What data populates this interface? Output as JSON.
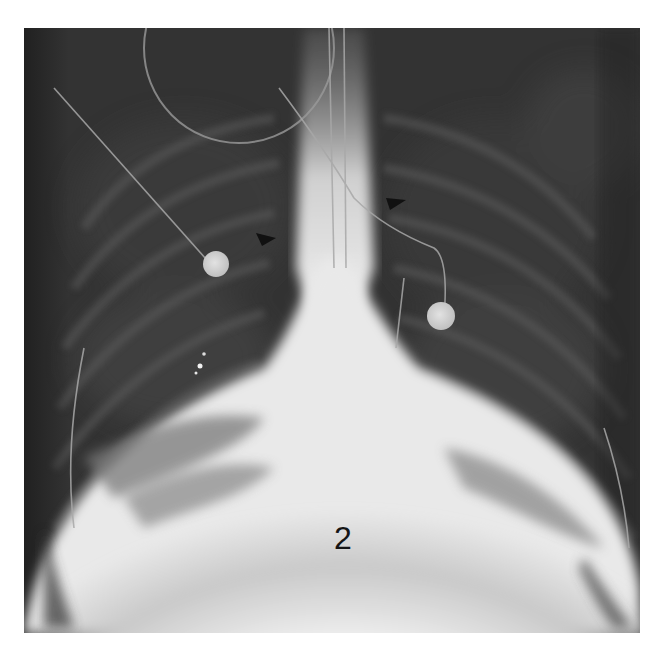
{
  "figure": {
    "kind": "chest radiograph (frontal view), grayscale",
    "panel_label": "2",
    "annotations": {
      "arrowheads": [
        {
          "name": "right-hilum-arrowhead",
          "approx_x": 266,
          "approx_y": 237,
          "color": "#111111"
        },
        {
          "name": "left-upper-arrowhead",
          "approx_x": 396,
          "approx_y": 200,
          "color": "#111111"
        }
      ],
      "ecg_electrodes": [
        {
          "name": "electrode-right",
          "approx_x": 216,
          "approx_y": 264
        },
        {
          "name": "electrode-left",
          "approx_x": 441,
          "approx_y": 316
        }
      ]
    },
    "colors": {
      "background": "#ffffff",
      "lung_field": "#2e2e2e",
      "dense_opacity": "#f0f0f0",
      "label_text": "#151515"
    }
  }
}
